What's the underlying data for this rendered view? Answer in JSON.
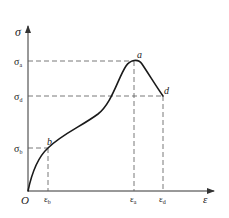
{
  "diagram": {
    "axes": {
      "y_label": "σ",
      "x_label": "ε",
      "origin_label": "O"
    },
    "y_ticks": [
      {
        "label_base": "σ",
        "sub": "a",
        "y": 61
      },
      {
        "label_base": "σ",
        "sub": "d",
        "y": 96
      },
      {
        "label_base": "σ",
        "sub": "b",
        "y": 148
      }
    ],
    "x_ticks": [
      {
        "label_base": "ε",
        "sub": "b",
        "x": 48
      },
      {
        "label_base": "ε",
        "sub": "a",
        "x": 134
      },
      {
        "label_base": "ε",
        "sub": "d",
        "x": 163
      }
    ],
    "points": [
      {
        "label": "a",
        "x": 134,
        "y": 61
      },
      {
        "label": "b",
        "x": 48,
        "y": 148
      },
      {
        "label": "d",
        "x": 163,
        "y": 96
      }
    ],
    "colors": {
      "line": "#1a1a1a",
      "axis": "#333333",
      "dash": "#555555"
    }
  }
}
